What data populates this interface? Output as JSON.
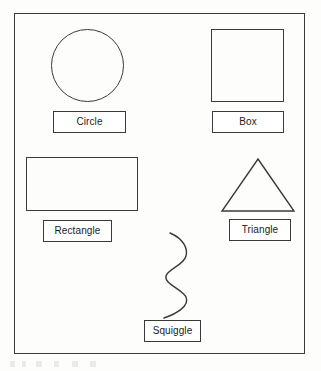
{
  "document": {
    "kind": "scanned-shape-diagram",
    "frame_border_color": "#3a3a3a",
    "ink_color": "#1b1b1b",
    "paper_color": "#fdfdfc"
  },
  "diagram": {
    "shapes": [
      {
        "id": "circle",
        "icon": "circle-shape",
        "label": "Circle",
        "geometry": {
          "type": "circle",
          "x": 50,
          "y": 28,
          "width": 73,
          "height": 73
        },
        "caption_box": {
          "x": 52,
          "y": 110,
          "width": 73,
          "height": 22
        }
      },
      {
        "id": "box",
        "icon": "square-shape",
        "label": "Box",
        "geometry": {
          "type": "square",
          "x": 210,
          "y": 28,
          "width": 73,
          "height": 73
        },
        "caption_box": {
          "x": 211,
          "y": 110,
          "width": 72,
          "height": 22
        }
      },
      {
        "id": "rectangle",
        "icon": "rectangle-shape",
        "label": "Rectangle",
        "geometry": {
          "type": "rectangle",
          "x": 25,
          "y": 156,
          "width": 112,
          "height": 54
        },
        "caption_box": {
          "x": 42,
          "y": 219,
          "width": 69,
          "height": 22
        }
      },
      {
        "id": "triangle",
        "icon": "triangle-shape",
        "label": "Triangle",
        "geometry": {
          "type": "triangle",
          "x": 218,
          "y": 154,
          "width": 78,
          "height": 60
        },
        "caption_box": {
          "x": 228,
          "y": 218,
          "width": 62,
          "height": 22
        }
      },
      {
        "id": "squiggle",
        "icon": "squiggle-shape",
        "label": "Squiggle",
        "geometry": {
          "type": "freeform-curve",
          "x": 155,
          "y": 228,
          "width": 48,
          "height": 95
        },
        "caption_box": {
          "x": 143,
          "y": 319,
          "width": 57,
          "height": 22
        }
      }
    ]
  }
}
